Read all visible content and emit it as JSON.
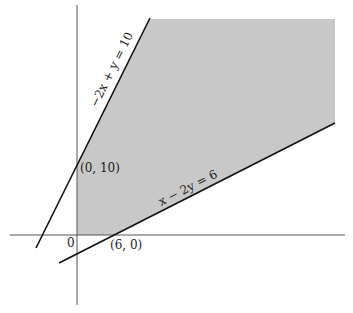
{
  "diagram": {
    "type": "feasible-region",
    "colors": {
      "region": "#c8c8c8",
      "line": "#111111",
      "axis": "#555555"
    },
    "axes": {
      "origin_label": "0"
    },
    "lines": [
      {
        "name": "line-2x-plus-y",
        "label": "−2x + y = 10"
      },
      {
        "name": "line-x-minus-2y",
        "label": "x − 2y = 6"
      }
    ],
    "points": [
      {
        "name": "point-0-10",
        "label": "(0, 10)"
      },
      {
        "name": "point-6-0",
        "label": "(6, 0)"
      }
    ]
  }
}
